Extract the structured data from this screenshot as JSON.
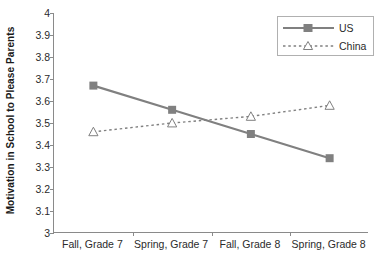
{
  "chart_data": {
    "type": "line",
    "title": "",
    "xlabel": "",
    "ylabel": "Motivation in School to Please Parents",
    "categories": [
      "Fall, Grade 7",
      "Spring, Grade 7",
      "Fall, Grade 8",
      "Spring, Grade 8"
    ],
    "series": [
      {
        "name": "US",
        "values": [
          3.67,
          3.56,
          3.45,
          3.34
        ],
        "color": "#808080",
        "line_style": "solid",
        "marker": "filled-square"
      },
      {
        "name": "China",
        "values": [
          3.46,
          3.5,
          3.53,
          3.58
        ],
        "color": "#808080",
        "line_style": "dotted",
        "marker": "open-triangle"
      }
    ],
    "ylim": [
      3,
      4
    ],
    "yticks": [
      3,
      3.1,
      3.2,
      3.3,
      3.4,
      3.5,
      3.6,
      3.7,
      3.8,
      3.9,
      4
    ],
    "ytick_labels": [
      "3",
      "3.1",
      "3.2",
      "3.3",
      "3.4",
      "3.5",
      "3.6",
      "3.7",
      "3.8",
      "3.9",
      "4"
    ],
    "grid": false,
    "legend_position": "top-right",
    "legend_entries": [
      "US",
      "China"
    ],
    "axis_color": "#8a8a8a",
    "background": "#ffffff"
  }
}
